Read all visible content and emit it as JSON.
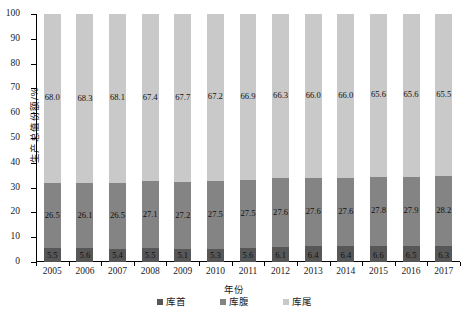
{
  "chart_data": {
    "type": "bar",
    "stacked": true,
    "stack_mode": "percent",
    "title": "",
    "xlabel": "年份",
    "ylabel": "生产总值份额/%",
    "ylim": [
      0,
      100
    ],
    "yticks": [
      0,
      10,
      20,
      30,
      40,
      50,
      60,
      70,
      80,
      90,
      100
    ],
    "grid": false,
    "legend_position": "bottom",
    "categories": [
      "2005",
      "2006",
      "2007",
      "2008",
      "2009",
      "2010",
      "2011",
      "2012",
      "2013",
      "2014",
      "2015",
      "2016",
      "2017"
    ],
    "series": [
      {
        "name": "库首",
        "color": "#575757",
        "values": [
          5.5,
          5.6,
          5.4,
          5.5,
          5.1,
          5.3,
          5.6,
          6.1,
          6.4,
          6.4,
          6.6,
          6.5,
          6.3
        ],
        "labels": [
          "5.5",
          "5.6",
          "5.4",
          "5.5",
          "5.1",
          "5.3",
          "5.6",
          "6.1",
          "6.4",
          "6.4",
          "6.6",
          "6.5",
          "6.3"
        ]
      },
      {
        "name": "库腹",
        "color": "#848484",
        "values": [
          26.5,
          26.1,
          26.5,
          27.1,
          27.2,
          27.5,
          27.5,
          27.6,
          27.6,
          27.6,
          27.8,
          27.9,
          28.2
        ],
        "labels": [
          "26.5",
          "26.1",
          "26.5",
          "27.1",
          "27.2",
          "27.5",
          "27.5",
          "27.6",
          "27.6",
          "27.6",
          "27.8",
          "27.9",
          "28.2"
        ]
      },
      {
        "name": "库尾",
        "color": "#c9c9c9",
        "values": [
          68.0,
          68.3,
          68.1,
          67.4,
          67.7,
          67.2,
          66.9,
          66.3,
          66.0,
          66.0,
          65.6,
          65.6,
          65.5
        ],
        "labels": [
          "68.0",
          "68.3",
          "68.1",
          "67.4",
          "67.7",
          "67.2",
          "66.9",
          "66.3",
          "66.0",
          "66.0",
          "65.6",
          "65.6",
          "65.5"
        ]
      }
    ]
  }
}
